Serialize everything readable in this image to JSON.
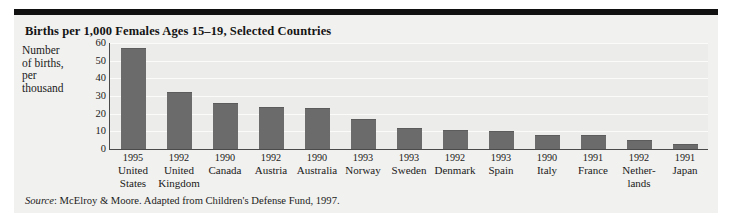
{
  "figure": {
    "title": "Births per 1,000 Females Ages 15–19, Selected Countries",
    "axis_title_lines": [
      "Number",
      "of births,",
      "per",
      "thousand"
    ],
    "source_lead": "Source",
    "source_text": ": McElroy & Moore. Adapted from Children's Defense Fund, 1997.",
    "colors": {
      "bar": "#6b6b6b",
      "panel_background": "#f1f1ef",
      "plot_background": "#ececea",
      "gridline": "#fbfbfa",
      "axis": "#4a4a4a",
      "top_rule": "#111111"
    }
  },
  "chart_data": {
    "type": "bar",
    "title": "Births per 1,000 Females Ages 15–19, Selected Countries",
    "xlabel": "",
    "ylabel": "Number of births, per thousand",
    "ylim": [
      0,
      60
    ],
    "yticks": [
      0,
      10,
      20,
      30,
      40,
      50,
      60
    ],
    "ytick_labels": [
      "0",
      "10",
      "20",
      "30",
      "40",
      "50",
      "60"
    ],
    "grid": true,
    "legend": "none",
    "categories": [
      "United States",
      "United Kingdom",
      "Canada",
      "Austria",
      "Australia",
      "Norway",
      "Sweden",
      "Denmark",
      "Spain",
      "Italy",
      "France",
      "Netherlands",
      "Japan"
    ],
    "years": [
      1995,
      1992,
      1990,
      1992,
      1990,
      1993,
      1993,
      1992,
      1993,
      1990,
      1991,
      1992,
      1991
    ],
    "values": [
      57,
      32,
      26,
      24,
      23,
      17,
      12,
      11,
      10,
      8,
      8,
      5,
      3
    ],
    "tick_items": [
      {
        "year": "1995",
        "name_lines": [
          "United",
          "States"
        ],
        "value": 57
      },
      {
        "year": "1992",
        "name_lines": [
          "United",
          "Kingdom"
        ],
        "value": 32
      },
      {
        "year": "1990",
        "name_lines": [
          "Canada"
        ],
        "value": 26
      },
      {
        "year": "1992",
        "name_lines": [
          "Austria"
        ],
        "value": 24
      },
      {
        "year": "1990",
        "name_lines": [
          "Australia"
        ],
        "value": 23
      },
      {
        "year": "1993",
        "name_lines": [
          "Norway"
        ],
        "value": 17
      },
      {
        "year": "1993",
        "name_lines": [
          "Sweden"
        ],
        "value": 12
      },
      {
        "year": "1992",
        "name_lines": [
          "Denmark"
        ],
        "value": 11
      },
      {
        "year": "1993",
        "name_lines": [
          "Spain"
        ],
        "value": 10
      },
      {
        "year": "1990",
        "name_lines": [
          "Italy"
        ],
        "value": 8
      },
      {
        "year": "1991",
        "name_lines": [
          "France"
        ],
        "value": 8
      },
      {
        "year": "1992",
        "name_lines": [
          "Nether-",
          "lands"
        ],
        "value": 5
      },
      {
        "year": "1991",
        "name_lines": [
          "Japan"
        ],
        "value": 3
      }
    ]
  }
}
